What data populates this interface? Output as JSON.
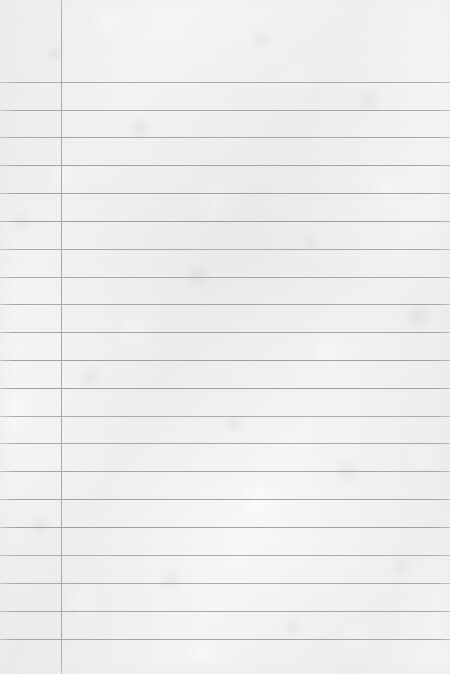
{
  "page": {
    "kind": "lined-notebook-paper",
    "width_px": 450,
    "height_px": 674,
    "text_content": ""
  },
  "colors": {
    "paper_base": "#f6f6f4",
    "paper_highlight": "#ffffff",
    "paper_shadow": "#d6d6d4",
    "horizontal_rule": "#9b9b9f",
    "margin_rule": "#a6a6aa"
  },
  "ruling": {
    "margin_rule_x": 61,
    "margin_rule_width": 1,
    "first_line_y": 82,
    "line_spacing": 27.8,
    "line_thickness": 1,
    "line_count": 21,
    "horizontal_line_y": [
      82,
      110,
      137,
      165,
      193,
      221,
      249,
      277,
      304,
      332,
      360,
      388,
      416,
      443,
      471,
      499,
      527,
      555,
      583,
      611,
      639
    ]
  }
}
